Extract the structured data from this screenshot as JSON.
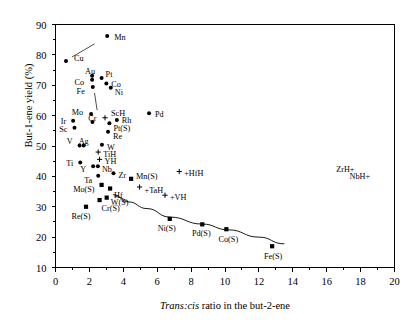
{
  "chart_data": {
    "type": "scatter",
    "title": "",
    "xlabel": "Trans:cis ratio in the but-2-ene",
    "xlabel_italic_part": "Trans:cis",
    "xlabel_rest": " ratio in the but-2-ene",
    "ylabel": "But-1-ene yield (%)",
    "xlim": [
      0,
      20
    ],
    "ylim": [
      10,
      90
    ],
    "xticks": [
      0,
      2,
      4,
      6,
      8,
      10,
      12,
      14,
      16,
      18,
      20
    ],
    "xtick_labels": [
      "0",
      "2",
      "4",
      "6",
      "8",
      "10",
      "12",
      "14",
      "16",
      "18",
      "20"
    ],
    "yticks": [
      10,
      20,
      30,
      40,
      50,
      60,
      70,
      80,
      90
    ],
    "ytick_labels": [
      "10",
      "20",
      "30",
      "40",
      "50",
      "60",
      "70",
      "80",
      "90"
    ],
    "x_minor_tick_count": 1,
    "y_minor_tick_count": 1,
    "grid": false,
    "legend": "none",
    "marker_styles": {
      "circle": "metal catalyst",
      "square": "sulfided catalyst",
      "plus": "hydride species"
    },
    "series": [
      {
        "name": "Metals (circle markers)",
        "marker": "circle",
        "points": [
          {
            "label": "Mn",
            "x": 3.05,
            "y": 86.2,
            "lx": 7,
            "ly": 1,
            "anchor": "start"
          },
          {
            "label": "Cu",
            "x": 0.62,
            "y": 78.0,
            "lx": 8,
            "ly": -3,
            "anchor": "start",
            "leader": {
              "x2": 2.3,
              "y2": 83.6
            }
          },
          {
            "label": "Au",
            "x": 2.16,
            "y": 73.1,
            "lx": -2,
            "ly": -5,
            "anchor": "middle"
          },
          {
            "label": "Pt",
            "x": 2.72,
            "y": 72.4,
            "lx": 4,
            "ly": -4,
            "anchor": "start"
          },
          {
            "label": "Co",
            "x": 2.16,
            "y": 71.8,
            "lx": -8,
            "ly": 2,
            "anchor": "end"
          },
          {
            "label": "Co",
            "x": 3.0,
            "y": 70.6,
            "lx": 5,
            "ly": 1,
            "anchor": "start"
          },
          {
            "label": "Ni",
            "x": 3.26,
            "y": 69.2,
            "lx": 4,
            "ly": 4,
            "anchor": "start"
          },
          {
            "label": "Fe",
            "x": 2.2,
            "y": 69.4,
            "lx": -8,
            "ly": 4,
            "anchor": "end"
          },
          {
            "label": "Mo",
            "x": 2.1,
            "y": 60.5,
            "lx": -8,
            "ly": -2,
            "anchor": "end",
            "leader": {
              "x2": 2.3,
              "y2": 67.5
            }
          },
          {
            "label": "ScH",
            "x": 2.92,
            "y": 59.3,
            "lx": 6,
            "ly": -5,
            "anchor": "start",
            "marker": "plus"
          },
          {
            "label": "Pd",
            "x": 5.52,
            "y": 60.8,
            "lx": 6,
            "ly": 1,
            "anchor": "start"
          },
          {
            "label": "Rh",
            "x": 3.62,
            "y": 58.6,
            "lx": 5,
            "ly": 0,
            "anchor": "start"
          },
          {
            "label": "Ir",
            "x": 1.04,
            "y": 58.3,
            "lx": -7,
            "ly": 0,
            "anchor": "end"
          },
          {
            "label": "Cr",
            "x": 2.18,
            "y": 57.9,
            "lx": 0,
            "ly": -4,
            "anchor": "middle"
          },
          {
            "label": "Pt(S)",
            "x": 3.18,
            "y": 57.5,
            "lx": 4,
            "ly": 5,
            "anchor": "start"
          },
          {
            "label": "Sc",
            "x": 1.12,
            "y": 56.0,
            "lx": -7,
            "ly": 1,
            "anchor": "end"
          },
          {
            "label": "Re",
            "x": 3.1,
            "y": 54.7,
            "lx": 5,
            "ly": 4,
            "anchor": "start"
          },
          {
            "label": "Ag",
            "x": 1.66,
            "y": 50.2,
            "lx": 0,
            "ly": -4,
            "anchor": "middle"
          },
          {
            "label": "V",
            "x": 1.42,
            "y": 50.2,
            "lx": -7,
            "ly": -4,
            "anchor": "end"
          },
          {
            "label": "W",
            "x": 2.74,
            "y": 50.4,
            "lx": 5,
            "ly": 2,
            "anchor": "start"
          },
          {
            "label": "TiH",
            "x": 2.52,
            "y": 48.0,
            "lx": 5,
            "ly": 2,
            "anchor": "start",
            "marker": "plus"
          },
          {
            "label": "YH",
            "x": 2.6,
            "y": 45.6,
            "lx": 5,
            "ly": 2,
            "anchor": "start",
            "marker": "plus"
          },
          {
            "label": "Ti",
            "x": 1.46,
            "y": 44.6,
            "lx": -7,
            "ly": 1,
            "anchor": "end"
          },
          {
            "label": "Nb",
            "x": 2.5,
            "y": 43.3,
            "lx": 4,
            "ly": 3,
            "anchor": "start"
          },
          {
            "label": "Y",
            "x": 2.22,
            "y": 43.3,
            "lx": -7,
            "ly": 3,
            "anchor": "end"
          },
          {
            "label": "Zr",
            "x": 3.42,
            "y": 41.0,
            "lx": 5,
            "ly": 2,
            "anchor": "start"
          },
          {
            "label": "Ta",
            "x": 2.52,
            "y": 40.2,
            "lx": -6,
            "ly": 4,
            "anchor": "end"
          }
        ]
      },
      {
        "name": "Sulfided catalysts (square markers)",
        "marker": "square",
        "points": [
          {
            "label": "Mn(S)",
            "x": 4.46,
            "y": 39.2,
            "lx": 5,
            "ly": -3,
            "anchor": "start"
          },
          {
            "label": "HfH",
            "x": 7.3,
            "y": 41.6,
            "lx": 5,
            "ly": 1,
            "anchor": "start",
            "marker": "plus",
            "prefix": "+"
          },
          {
            "label": "TaH",
            "x": 4.96,
            "y": 36.5,
            "lx": 5,
            "ly": 3,
            "anchor": "start",
            "marker": "plus",
            "prefix": "+"
          },
          {
            "label": "Mo(S)",
            "x": 2.72,
            "y": 37.2,
            "lx": -7,
            "ly": 4,
            "anchor": "end"
          },
          {
            "label": "Hf",
            "x": 3.22,
            "y": 36.0,
            "lx": 4,
            "ly": 6,
            "anchor": "start"
          },
          {
            "label": "W(S)",
            "x": 3.02,
            "y": 33.0,
            "lx": 4,
            "ly": 4,
            "anchor": "start"
          },
          {
            "label": "Cr(S)",
            "x": 2.6,
            "y": 32.2,
            "lx": 2,
            "ly": 8,
            "anchor": "start"
          },
          {
            "label": "VH",
            "x": 6.46,
            "y": 33.8,
            "lx": 5,
            "ly": 2,
            "anchor": "start",
            "marker": "plus",
            "prefix": "+"
          },
          {
            "label": "Re(S)",
            "x": 1.8,
            "y": 30.0,
            "lx": -5,
            "ly": 9,
            "anchor": "middle"
          },
          {
            "label": "Ni(S)",
            "x": 6.74,
            "y": 26.0,
            "lx": -3,
            "ly": 9,
            "anchor": "middle"
          },
          {
            "label": "Pd(S)",
            "x": 8.66,
            "y": 24.2,
            "lx": -1,
            "ly": 9,
            "anchor": "middle"
          },
          {
            "label": "Co(S)",
            "x": 10.08,
            "y": 22.6,
            "lx": 2,
            "ly": 10,
            "anchor": "middle"
          },
          {
            "label": "Fe(S)",
            "x": 12.78,
            "y": 17.0,
            "lx": 1,
            "ly": 10,
            "anchor": "middle"
          }
        ]
      }
    ],
    "trend_curve": {
      "description": "decreasing curve through sulfided catalyst points",
      "points": [
        {
          "x": 3.4,
          "y": 34.0
        },
        {
          "x": 4.3,
          "y": 31.6
        },
        {
          "x": 5.4,
          "y": 29.4
        },
        {
          "x": 6.74,
          "y": 26.6
        },
        {
          "x": 8.66,
          "y": 24.3
        },
        {
          "x": 10.2,
          "y": 22.4
        },
        {
          "x": 12.0,
          "y": 20.0
        },
        {
          "x": 13.5,
          "y": 17.8
        }
      ]
    },
    "free_annotations": [
      {
        "label": "ZrH+",
        "x": 17.1,
        "y": 41.6,
        "anchor": "middle"
      },
      {
        "label": "NbH+",
        "x": 17.95,
        "y": 39.3,
        "anchor": "middle"
      }
    ]
  }
}
